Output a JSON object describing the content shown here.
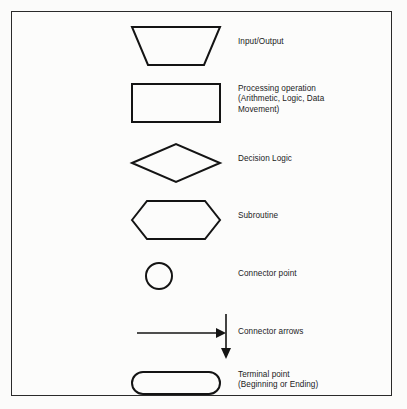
{
  "diagram": {
    "type": "flowchart-symbol-legend",
    "background_color": "#fbfbfa",
    "stroke_color": "#141414",
    "border_color": "#2a2a2a",
    "rows": [
      {
        "symbol": "trapezoid-input-output",
        "label": "Input/Output",
        "label_lines": [
          "Input/Output"
        ]
      },
      {
        "symbol": "rectangle-process",
        "label": "Processing operation (Arithmetic, Logic, Data Movement)",
        "label_lines": [
          "Processing operation",
          "(Arithmetic, Logic, Data",
          "Movement)"
        ]
      },
      {
        "symbol": "diamond-decision",
        "label": "Decision Logic",
        "label_lines": [
          "Decision Logic"
        ]
      },
      {
        "symbol": "hexagon-subroutine",
        "label": "Subroutine",
        "label_lines": [
          "Subroutine"
        ]
      },
      {
        "symbol": "circle-connector",
        "label": "Connector point",
        "label_lines": [
          "Connector point"
        ]
      },
      {
        "symbol": "arrows-connector",
        "label": "Connector arrows",
        "label_lines": [
          "Connector arrows"
        ]
      },
      {
        "symbol": "stadium-terminal",
        "label": "Terminal point (Beginning or Ending)",
        "label_lines": [
          "Terminal point",
          "(Beginning or Ending)"
        ]
      }
    ]
  }
}
